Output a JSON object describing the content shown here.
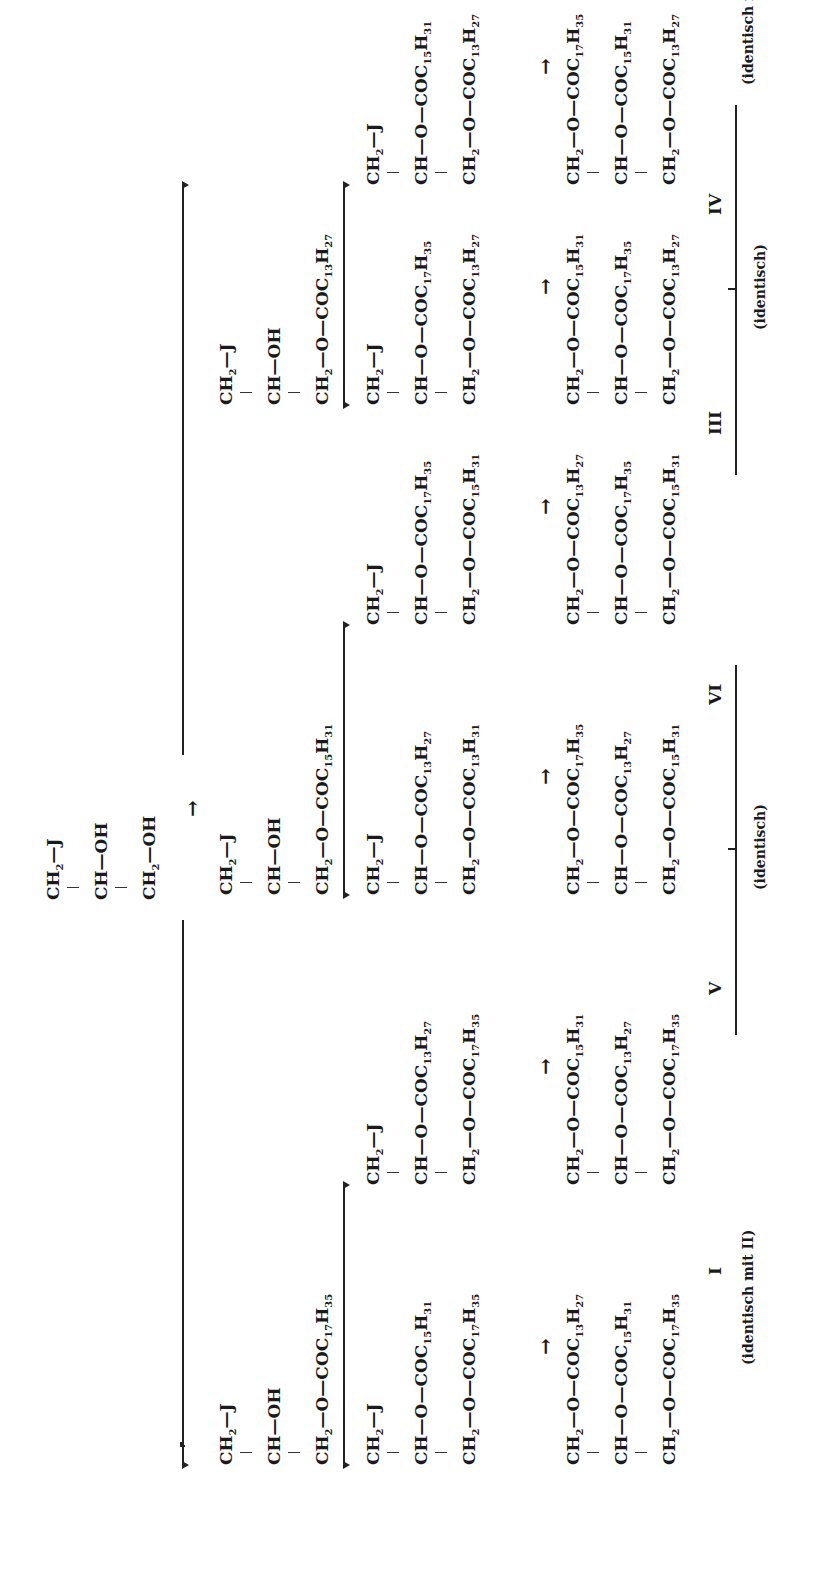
{
  "figure": {
    "orientation": "rotated 90° counter-clockwise",
    "start": {
      "rows": [
        {
          "pre": "CH",
          "sub1": "2",
          "mid": "—J",
          "sub2": "",
          "post": ""
        },
        {
          "pre": "CH—OH",
          "sub1": "",
          "mid": "",
          "sub2": "",
          "post": ""
        },
        {
          "pre": "CH",
          "sub1": "2",
          "mid": "—OH",
          "sub2": "",
          "post": ""
        }
      ]
    },
    "main_arrow": "→",
    "intermediates": [
      {
        "id": "int_c17",
        "rows": [
          {
            "pre": "CH",
            "sub1": "2",
            "mid": "—J"
          },
          {
            "pre": "CH—OH",
            "sub1": "",
            "mid": ""
          },
          {
            "pre": "CH",
            "sub1": "2",
            "mid": "—O—COC",
            "c": "17",
            "h": "35"
          }
        ]
      },
      {
        "id": "int_c15",
        "rows": [
          {
            "pre": "CH",
            "sub1": "2",
            "mid": "—J"
          },
          {
            "pre": "CH—OH",
            "sub1": "",
            "mid": ""
          },
          {
            "pre": "CH",
            "sub1": "2",
            "mid": "—O—COC",
            "c": "15",
            "h": "31"
          }
        ]
      },
      {
        "id": "int_c13",
        "rows": [
          {
            "pre": "CH",
            "sub1": "2",
            "mid": "—J"
          },
          {
            "pre": "CH—OH",
            "sub1": "",
            "mid": ""
          },
          {
            "pre": "CH",
            "sub1": "2",
            "mid": "—O—COC",
            "c": "13",
            "h": "27"
          }
        ]
      }
    ],
    "diesters": [
      {
        "rows": [
          [
            "CH",
            "2",
            "—J",
            "",
            ""
          ],
          [
            "CH—O—COC",
            "",
            "",
            "15",
            "31"
          ],
          [
            "CH",
            "2",
            "—O—COC",
            "17",
            "35"
          ]
        ]
      },
      {
        "rows": [
          [
            "CH",
            "2",
            "—J",
            "",
            ""
          ],
          [
            "CH—O—COC",
            "",
            "",
            "13",
            "27"
          ],
          [
            "CH",
            "2",
            "—O—COC",
            "17",
            "35"
          ]
        ]
      },
      {
        "rows": [
          [
            "CH",
            "2",
            "—J",
            "",
            ""
          ],
          [
            "CH—O—COC",
            "",
            "",
            "13",
            "27"
          ],
          [
            "CH",
            "2",
            "—O—COC",
            "13",
            "31"
          ]
        ]
      },
      {
        "rows": [
          [
            "CH",
            "2",
            "—J",
            "",
            ""
          ],
          [
            "CH—O—COC",
            "",
            "",
            "17",
            "35"
          ],
          [
            "CH",
            "2",
            "—O—COC",
            "15",
            "31"
          ]
        ]
      },
      {
        "rows": [
          [
            "CH",
            "2",
            "—J",
            "",
            ""
          ],
          [
            "CH—O—COC",
            "",
            "",
            "17",
            "35"
          ],
          [
            "CH",
            "2",
            "—O—COC",
            "13",
            "27"
          ]
        ]
      },
      {
        "rows": [
          [
            "CH",
            "2",
            "—J",
            "",
            ""
          ],
          [
            "CH—O—COC",
            "",
            "",
            "15",
            "31"
          ],
          [
            "CH",
            "2",
            "—O—COC",
            "13",
            "27"
          ]
        ]
      }
    ],
    "triglycerides": [
      {
        "label": "I",
        "note": "(identisch mit II)",
        "rows": [
          [
            "CH",
            "2",
            "—O—COC",
            "13",
            "27"
          ],
          [
            "CH—O—COC",
            "",
            "",
            "15",
            "31"
          ],
          [
            "CH",
            "2",
            "—O—COC",
            "17",
            "35"
          ]
        ]
      },
      {
        "label": "V",
        "note": "",
        "rows": [
          [
            "CH",
            "2",
            "—O—COC",
            "15",
            "31"
          ],
          [
            "CH—O—COC",
            "",
            "",
            "13",
            "27"
          ],
          [
            "CH",
            "2",
            "—O—COC",
            "17",
            "35"
          ]
        ]
      },
      {
        "label": "VI",
        "note": "",
        "rows": [
          [
            "CH",
            "2",
            "—O—COC",
            "17",
            "35"
          ],
          [
            "CH—O—COC",
            "",
            "",
            "13",
            "27"
          ],
          [
            "CH",
            "2",
            "—O—COC",
            "15",
            "31"
          ]
        ]
      },
      {
        "label": "III",
        "note": "",
        "rows": [
          [
            "CH",
            "2",
            "—O—COC",
            "13",
            "27"
          ],
          [
            "CH—O—COC",
            "",
            "",
            "17",
            "35"
          ],
          [
            "CH",
            "2",
            "—O—COC",
            "15",
            "31"
          ]
        ]
      },
      {
        "label": "IV",
        "note": "",
        "rows": [
          [
            "CH",
            "2",
            "—O—COC",
            "15",
            "31"
          ],
          [
            "CH—O—COC",
            "",
            "",
            "17",
            "35"
          ],
          [
            "CH",
            "2",
            "—O—COC",
            "13",
            "27"
          ]
        ]
      },
      {
        "label": "II",
        "note": "(identisch mit I)",
        "rows": [
          [
            "CH",
            "2",
            "—O—COC",
            "17",
            "35"
          ],
          [
            "CH—O—COC",
            "",
            "",
            "15",
            "31"
          ],
          [
            "CH",
            "2",
            "—O—COC",
            "13",
            "27"
          ]
        ]
      }
    ],
    "braces": [
      {
        "spans": "V–VI",
        "label": "(identisch)"
      },
      {
        "spans": "III–IV",
        "label": "(identisch)"
      }
    ]
  }
}
